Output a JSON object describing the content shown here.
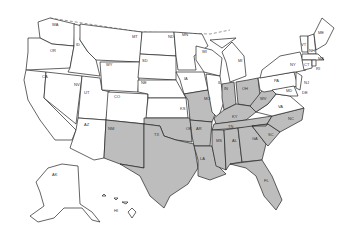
{
  "map": {
    "title": "United States map with highlighted states",
    "colors": {
      "highlighted": "#bdbdbd",
      "unhighlighted": "#ffffff",
      "outline": "#222222"
    },
    "highlighted_states": [
      "NM",
      "TX",
      "OK",
      "AR",
      "LA",
      "MO",
      "KY",
      "TN",
      "MS",
      "AL",
      "GA",
      "FL",
      "SC",
      "NC",
      "WV",
      "IN",
      "OH"
    ],
    "labels": {
      "WA": "WA",
      "OR": "OR",
      "CA": "CA",
      "ID": "ID",
      "NV": "NV",
      "UT": "UT",
      "AZ": "AZ",
      "MT": "MT",
      "WY": "WY",
      "CO": "CO",
      "NM": "NM",
      "ND": "ND",
      "SD": "SD",
      "NE": "NE",
      "KS": "KS",
      "OK": "OK",
      "TX": "TX",
      "MN": "MN",
      "IA": "IA",
      "MO": "MO",
      "AR": "AR",
      "LA": "LA",
      "WI": "WI",
      "IL": "IL",
      "MI": "MI",
      "IN": "IN",
      "OH": "OH",
      "KY": "KY",
      "TN": "TN",
      "MS": "MS",
      "AL": "AL",
      "GA": "GA",
      "FL": "FL",
      "SC": "SC",
      "NC": "NC",
      "VA": "VA",
      "WV": "WV",
      "PA": "PA",
      "NY": "NY",
      "ME": "ME",
      "VT": "VT",
      "NH": "NH",
      "MA": "MA",
      "CT": "CT",
      "RI": "RI",
      "NJ": "NJ",
      "DE": "DE",
      "MD": "MD",
      "AK": "AK",
      "HI": "HI"
    }
  }
}
